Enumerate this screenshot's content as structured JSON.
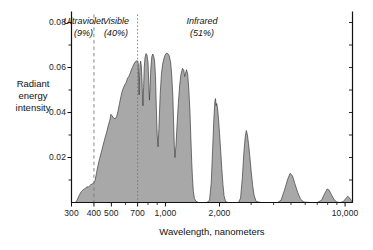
{
  "chart_data": {
    "type": "area",
    "title": "",
    "xlabel": "Wavelength, nanometers",
    "ylabel": "Radiant energy intensity",
    "xscale": "log",
    "xlim": [
      300,
      11000
    ],
    "ylim": [
      0,
      0.084
    ],
    "grid": false,
    "legend": "none",
    "xticks": [
      300,
      400,
      500,
      700,
      1000,
      2000,
      10000
    ],
    "xtick_labels": [
      "300",
      "400",
      "500",
      "700",
      "1,000",
      "2,000",
      "10,000"
    ],
    "xminor_ticks": [
      600,
      800,
      900,
      3000,
      4000,
      5000,
      6000,
      7000,
      8000,
      9000
    ],
    "yticks": [
      0.02,
      0.04,
      0.06,
      0.08
    ],
    "ytick_labels": [
      "0.02",
      "0.04",
      "0.06",
      "0.08"
    ],
    "yminor_ticks": [
      0.01,
      0.03,
      0.05,
      0.07
    ],
    "series_name": "Solar radiant energy intensity",
    "fill_color": "#a8a8a8",
    "line_color": "#3c3c3c",
    "axis_color": "#111111",
    "divider_color": "#777777",
    "dividers": [
      {
        "x": 400,
        "style": "dashed"
      },
      {
        "x": 700,
        "style": "dotted"
      }
    ],
    "annotations": [
      {
        "name": "ultraviolet",
        "text": "Ultraviolet",
        "sub": "(9%)",
        "x_center": 350,
        "percent": 9
      },
      {
        "name": "visible",
        "text": "Visible",
        "sub": "(40%)",
        "x_center": 530,
        "percent": 40
      },
      {
        "name": "infrared",
        "text": "Infrared",
        "sub": "(51%)",
        "x_center": 1600,
        "percent": 51
      }
    ],
    "points": [
      [
        300,
        0.0
      ],
      [
        315,
        0.0
      ],
      [
        322,
        0.001
      ],
      [
        330,
        0.003
      ],
      [
        340,
        0.0048
      ],
      [
        350,
        0.0058
      ],
      [
        358,
        0.0062
      ],
      [
        365,
        0.007
      ],
      [
        372,
        0.0068
      ],
      [
        378,
        0.0074
      ],
      [
        385,
        0.008
      ],
      [
        392,
        0.0082
      ],
      [
        400,
        0.009
      ],
      [
        405,
        0.0094
      ],
      [
        412,
        0.0125
      ],
      [
        420,
        0.016
      ],
      [
        430,
        0.0195
      ],
      [
        440,
        0.0225
      ],
      [
        450,
        0.0255
      ],
      [
        460,
        0.0285
      ],
      [
        470,
        0.031
      ],
      [
        480,
        0.034
      ],
      [
        490,
        0.0365
      ],
      [
        497,
        0.0392
      ],
      [
        505,
        0.0385
      ],
      [
        515,
        0.0375
      ],
      [
        525,
        0.0372
      ],
      [
        535,
        0.0382
      ],
      [
        545,
        0.0408
      ],
      [
        555,
        0.044
      ],
      [
        565,
        0.047
      ],
      [
        575,
        0.0495
      ],
      [
        585,
        0.0512
      ],
      [
        595,
        0.0524
      ],
      [
        605,
        0.0533
      ],
      [
        615,
        0.0552
      ],
      [
        625,
        0.056
      ],
      [
        635,
        0.0572
      ],
      [
        645,
        0.0588
      ],
      [
        655,
        0.06
      ],
      [
        665,
        0.0612
      ],
      [
        675,
        0.0622
      ],
      [
        685,
        0.0628
      ],
      [
        695,
        0.063
      ],
      [
        700,
        0.0629
      ],
      [
        706,
        0.0618
      ],
      [
        710,
        0.054
      ],
      [
        714,
        0.0478
      ],
      [
        718,
        0.056
      ],
      [
        722,
        0.0615
      ],
      [
        728,
        0.0628
      ],
      [
        734,
        0.0608
      ],
      [
        740,
        0.055
      ],
      [
        745,
        0.048
      ],
      [
        750,
        0.043
      ],
      [
        756,
        0.051
      ],
      [
        762,
        0.06
      ],
      [
        770,
        0.0645
      ],
      [
        780,
        0.0662
      ],
      [
        790,
        0.0655
      ],
      [
        800,
        0.062
      ],
      [
        808,
        0.053
      ],
      [
        815,
        0.0455
      ],
      [
        822,
        0.052
      ],
      [
        830,
        0.06
      ],
      [
        840,
        0.0648
      ],
      [
        850,
        0.066
      ],
      [
        860,
        0.065
      ],
      [
        870,
        0.063
      ],
      [
        880,
        0.0565
      ],
      [
        890,
        0.042
      ],
      [
        900,
        0.03
      ],
      [
        910,
        0.0248
      ],
      [
        920,
        0.033
      ],
      [
        935,
        0.048
      ],
      [
        950,
        0.057
      ],
      [
        965,
        0.0615
      ],
      [
        980,
        0.0638
      ],
      [
        995,
        0.0655
      ],
      [
        1010,
        0.0663
      ],
      [
        1030,
        0.0662
      ],
      [
        1050,
        0.0652
      ],
      [
        1070,
        0.062
      ],
      [
        1085,
        0.056
      ],
      [
        1100,
        0.047
      ],
      [
        1110,
        0.036
      ],
      [
        1120,
        0.0255
      ],
      [
        1130,
        0.02
      ],
      [
        1145,
        0.0255
      ],
      [
        1160,
        0.034
      ],
      [
        1180,
        0.044
      ],
      [
        1200,
        0.052
      ],
      [
        1220,
        0.057
      ],
      [
        1245,
        0.0596
      ],
      [
        1265,
        0.0588
      ],
      [
        1280,
        0.056
      ],
      [
        1295,
        0.0575
      ],
      [
        1310,
        0.059
      ],
      [
        1330,
        0.057
      ],
      [
        1350,
        0.05
      ],
      [
        1370,
        0.04
      ],
      [
        1385,
        0.029
      ],
      [
        1400,
        0.0185
      ],
      [
        1415,
        0.0105
      ],
      [
        1430,
        0.005
      ],
      [
        1450,
        0.0018
      ],
      [
        1480,
        0.0005
      ],
      [
        1530,
        0.0
      ],
      [
        1600,
        0.0
      ],
      [
        1700,
        0.0
      ],
      [
        1760,
        0.001
      ],
      [
        1800,
        0.009
      ],
      [
        1830,
        0.023
      ],
      [
        1860,
        0.037
      ],
      [
        1885,
        0.045
      ],
      [
        1900,
        0.0462
      ],
      [
        1915,
        0.043
      ],
      [
        1930,
        0.044
      ],
      [
        1950,
        0.042
      ],
      [
        1975,
        0.037
      ],
      [
        2000,
        0.031
      ],
      [
        2030,
        0.023
      ],
      [
        2060,
        0.015
      ],
      [
        2090,
        0.008
      ],
      [
        2120,
        0.003
      ],
      [
        2160,
        0.0005
      ],
      [
        2230,
        0.0
      ],
      [
        2400,
        0.0
      ],
      [
        2550,
        0.0
      ],
      [
        2620,
        0.002
      ],
      [
        2680,
        0.011
      ],
      [
        2730,
        0.0215
      ],
      [
        2780,
        0.029
      ],
      [
        2820,
        0.032
      ],
      [
        2860,
        0.03
      ],
      [
        2900,
        0.0262
      ],
      [
        2950,
        0.0205
      ],
      [
        3000,
        0.014
      ],
      [
        3060,
        0.0075
      ],
      [
        3120,
        0.003
      ],
      [
        3200,
        0.0005
      ],
      [
        3400,
        0.0
      ],
      [
        3800,
        0.0
      ],
      [
        4200,
        0.0
      ],
      [
        4400,
        0.001
      ],
      [
        4600,
        0.0055
      ],
      [
        4800,
        0.0105
      ],
      [
        4950,
        0.013
      ],
      [
        5100,
        0.0118
      ],
      [
        5250,
        0.0085
      ],
      [
        5450,
        0.0045
      ],
      [
        5650,
        0.0015
      ],
      [
        5900,
        0.0002
      ],
      [
        6400,
        0.0
      ],
      [
        7000,
        0.0
      ],
      [
        7400,
        0.001
      ],
      [
        7700,
        0.004
      ],
      [
        7950,
        0.006
      ],
      [
        8150,
        0.0055
      ],
      [
        8400,
        0.0035
      ],
      [
        8700,
        0.0012
      ],
      [
        9000,
        0.0002
      ],
      [
        9400,
        0.0
      ],
      [
        9800,
        0.0005
      ],
      [
        10100,
        0.0018
      ],
      [
        10350,
        0.0028
      ],
      [
        10600,
        0.002
      ],
      [
        10850,
        0.0008
      ],
      [
        11000,
        0.0
      ]
    ]
  }
}
